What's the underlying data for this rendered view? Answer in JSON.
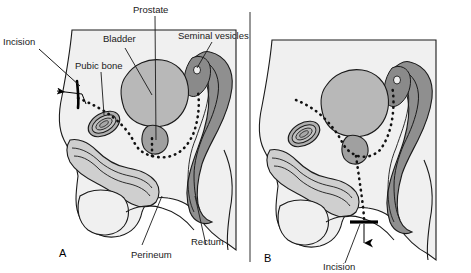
{
  "figure": {
    "panels": [
      {
        "letter": "A",
        "approach": "retropubic",
        "incision_label": "Incision"
      },
      {
        "letter": "B",
        "approach": "perineal",
        "incision_label": "Incision"
      }
    ]
  },
  "labels": {
    "incision_a": "Incision",
    "pubic_bone": "Pubic bone",
    "bladder": "Bladder",
    "prostate": "Prostate",
    "seminal_vesicles": "Seminal vesicles",
    "perineum": "Perineum",
    "rectum": "Rectum",
    "incision_b": "Incision",
    "panel_a": "A",
    "panel_b": "B"
  },
  "colors": {
    "background": "#ffffff",
    "body_fill": "#f0f0f0",
    "bladder_fill": "#b8b8b8",
    "prostate_fill": "#a0a0a0",
    "seminal_vesicle_fill": "#8a8a8a",
    "rectum_wall_fill": "#8f8f8f",
    "rectum_inner_fill": "#c4c4c4",
    "pubic_bone_fill": "#b0b0b0",
    "urethra_fill": "#cfcfcf",
    "outline": "#1a1a1a",
    "text": "#1a1a1a",
    "incision_mark": "#000000",
    "dissection_dots": "#111111"
  },
  "icons": {
    "incision_arrow_a": "arrow-left-icon",
    "incision_arrow_b": "arrow-down-icon",
    "incision_mark_a": "incision-mark-icon",
    "incision_mark_b": "incision-mark-icon"
  }
}
